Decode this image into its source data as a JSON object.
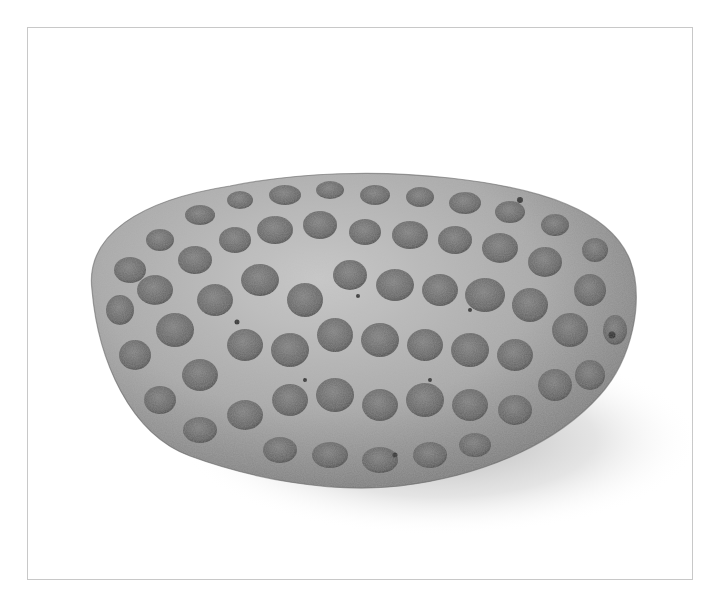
{
  "image": {
    "subject": "porous pumice-like stone",
    "alt": "Grayscale photograph of an oval, porous stone covered in pits, resting on a white background with a soft shadow",
    "frame_color": "#c8c8c8",
    "background_color": "#ffffff",
    "stone_base_color": "#8c8c8c",
    "stone_highlight_color": "#d9d9d9",
    "pit_color": "#5a5a5a"
  }
}
